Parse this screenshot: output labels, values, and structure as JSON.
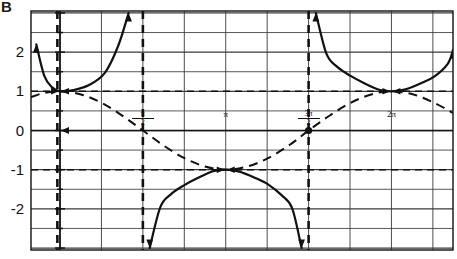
{
  "figure": {
    "label": "B",
    "caption_visible": false
  },
  "axes": {
    "y_ticks": [
      {
        "value": 2,
        "label": "2"
      },
      {
        "value": 1,
        "label": "1"
      },
      {
        "value": 0,
        "label": "0"
      },
      {
        "value": -1,
        "label": "-1"
      },
      {
        "value": -2,
        "label": "-2"
      }
    ],
    "x_ticks": [
      {
        "value": 1.5708,
        "numerator": "π",
        "denominator": "2"
      },
      {
        "value": 3.1416,
        "numerator": "π",
        "denominator": ""
      },
      {
        "value": 4.7124,
        "numerator": "3π",
        "denominator": "2"
      },
      {
        "value": 6.2832,
        "numerator": "2π",
        "denominator": ""
      }
    ],
    "x_range": [
      -0.55,
      7.45
    ],
    "y_range": [
      -3.05,
      3.05
    ],
    "grid": true,
    "grid_color": "#2b2b2b",
    "axis_color": "#111111"
  },
  "chart_data": {
    "type": "line",
    "title": "",
    "xlabel": "",
    "ylabel": "",
    "xlim": [
      -0.55,
      7.45
    ],
    "ylim": [
      -3.05,
      3.05
    ],
    "grid": true,
    "legend": "none",
    "series": [
      {
        "name": "secant",
        "style": "solid",
        "color": "#111111",
        "linewidth": 2.2,
        "arrow_ends": true,
        "description": "y = sec x, solid heavy curve with arrowheads approaching vertical asymptotes",
        "branches": [
          {
            "x_from": 1.5708,
            "x_to": 4.7124,
            "vertex_x": 3.1416,
            "vertex_y": -1,
            "points": [
              [
                1.7,
                -3.0
              ],
              [
                1.9,
                -1.96
              ],
              [
                2.1,
                -1.63
              ],
              [
                2.35,
                -1.4
              ],
              [
                2.6,
                -1.22
              ],
              [
                2.9,
                -1.04
              ],
              [
                3.1416,
                -1.0
              ],
              [
                3.4,
                -1.05
              ],
              [
                3.7,
                -1.21
              ],
              [
                3.95,
                -1.38
              ],
              [
                4.2,
                -1.65
              ],
              [
                4.4,
                -1.98
              ],
              [
                4.58,
                -3.0
              ]
            ]
          },
          {
            "x_from": 4.7124,
            "x_to": 7.854,
            "vertex_x": 6.2832,
            "vertex_y": 1,
            "points": [
              [
                4.85,
                3.0
              ],
              [
                5.05,
                1.96
              ],
              [
                5.25,
                1.63
              ],
              [
                5.5,
                1.4
              ],
              [
                5.75,
                1.22
              ],
              [
                6.05,
                1.04
              ],
              [
                6.2832,
                1.0
              ],
              [
                6.55,
                1.05
              ],
              [
                6.85,
                1.21
              ],
              [
                7.1,
                1.38
              ],
              [
                7.35,
                1.7
              ],
              [
                7.45,
                2.05
              ]
            ]
          },
          {
            "x_from": -1.5708,
            "x_to": 1.5708,
            "vertex_x": 0,
            "vertex_y": 1,
            "points": [
              [
                -0.45,
                2.2
              ],
              [
                -0.3,
                1.4
              ],
              [
                -0.15,
                1.1
              ],
              [
                0,
                1.0
              ],
              [
                0.25,
                1.03
              ],
              [
                0.55,
                1.16
              ],
              [
                0.85,
                1.47
              ],
              [
                1.1,
                2.15
              ],
              [
                1.3,
                3.0
              ]
            ]
          }
        ]
      },
      {
        "name": "cosine",
        "style": "dashed",
        "color": "#111111",
        "linewidth": 2.0,
        "description": "y = cos x, heavy dashed curve oscillating between 1 and -1",
        "points": [
          [
            -0.55,
            0.85
          ],
          [
            -0.3,
            0.96
          ],
          [
            0,
            1.0
          ],
          [
            0.4,
            0.92
          ],
          [
            0.8,
            0.7
          ],
          [
            1.2,
            0.36
          ],
          [
            1.5708,
            0
          ],
          [
            1.95,
            -0.37
          ],
          [
            2.35,
            -0.7
          ],
          [
            2.75,
            -0.92
          ],
          [
            3.1416,
            -1.0
          ],
          [
            3.55,
            -0.92
          ],
          [
            3.95,
            -0.7
          ],
          [
            4.35,
            -0.37
          ],
          [
            4.7124,
            0
          ],
          [
            5.1,
            0.37
          ],
          [
            5.5,
            0.7
          ],
          [
            5.9,
            0.92
          ],
          [
            6.2832,
            1.0
          ],
          [
            6.7,
            0.92
          ],
          [
            7.1,
            0.7
          ],
          [
            7.45,
            0.45
          ]
        ]
      }
    ],
    "asymptotes": {
      "style": "dashed",
      "color": "#111111",
      "vertical": [
        0.0,
        1.5708,
        4.7124,
        7.854
      ],
      "vertical_drawn_x": [
        -0.05,
        1.5708,
        4.7124,
        7.8
      ],
      "horizontal": [
        1,
        -1
      ]
    }
  }
}
